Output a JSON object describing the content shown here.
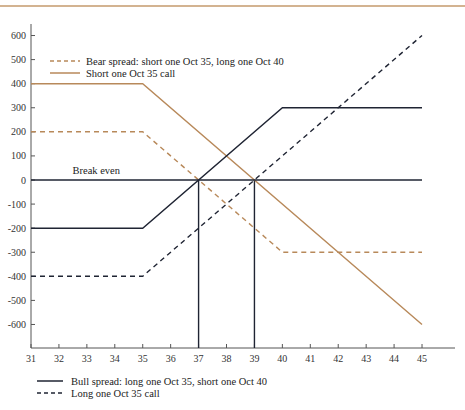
{
  "chart_data": {
    "type": "line",
    "title": "",
    "xlabel": "",
    "ylabel": "",
    "xlim": [
      31,
      45
    ],
    "ylim": [
      -700,
      650
    ],
    "x_ticks": [
      31,
      32,
      33,
      34,
      35,
      36,
      37,
      38,
      39,
      40,
      41,
      42,
      43,
      44,
      45
    ],
    "y_ticks": [
      600,
      500,
      400,
      300,
      200,
      100,
      0,
      -100,
      -200,
      -300,
      -400,
      -500,
      -600
    ],
    "grid": false,
    "annotations": [
      {
        "text": "Break even",
        "x": 32.2,
        "y": 0
      },
      {
        "type": "vline",
        "x": 37,
        "from_y": 0,
        "to_y": -700
      },
      {
        "type": "vline",
        "x": 39,
        "from_y": 0,
        "to_y": -700
      }
    ],
    "series": [
      {
        "name": "Bear spread: short one Oct 35, long one Oct 40",
        "style": "dashed",
        "color": "#b8895a",
        "x": [
          31,
          35,
          40,
          45
        ],
        "y": [
          200,
          200,
          -300,
          -300
        ]
      },
      {
        "name": "Short one Oct 35 call",
        "style": "solid",
        "color": "#b8895a",
        "x": [
          31,
          35,
          45
        ],
        "y": [
          400,
          400,
          -600
        ]
      },
      {
        "name": "Bull spread: long one Oct 35, short one Oct 40",
        "style": "solid",
        "color": "#1f2433",
        "x": [
          31,
          35,
          40,
          45
        ],
        "y": [
          -200,
          -200,
          300,
          300
        ]
      },
      {
        "name": "Long one Oct 35 call",
        "style": "dashed",
        "color": "#1f2433",
        "x": [
          31,
          35,
          45
        ],
        "y": [
          -400,
          -400,
          600
        ]
      },
      {
        "name": "Break even",
        "style": "solid",
        "color": "#1f2433",
        "x": [
          31,
          45
        ],
        "y": [
          0,
          0
        ]
      }
    ],
    "legend_top": [
      {
        "label": "Bear spread: short one Oct 35, long one Oct 40",
        "style": "dashed",
        "color": "#b8895a"
      },
      {
        "label": "Short one Oct 35 call",
        "style": "solid",
        "color": "#b8895a"
      }
    ],
    "legend_bottom": [
      {
        "label": "Bull spread: long one Oct 35, short one Oct 40",
        "style": "solid",
        "color": "#1f2433"
      },
      {
        "label": "Long one Oct 35 call",
        "style": "dashed",
        "color": "#1f2433"
      }
    ]
  },
  "colors": {
    "accent": "#b8895a",
    "dark": "#1f2433",
    "axis": "#555555",
    "top_rule": "#c49a6c"
  }
}
